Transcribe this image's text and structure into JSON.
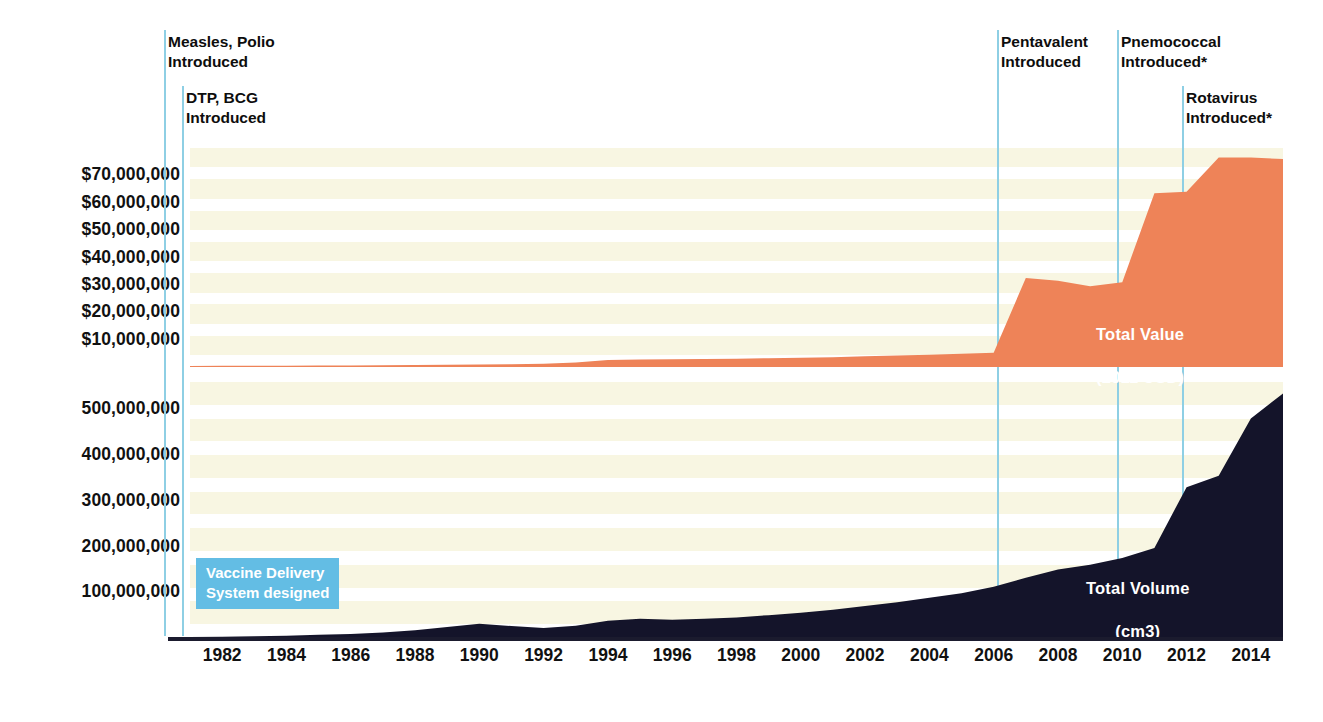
{
  "chart_data": {
    "type": "area",
    "title": "",
    "subtitle": "",
    "xlabel": "",
    "grid": true,
    "legend_position": "in-plot",
    "x": [
      1981,
      1982,
      1983,
      1984,
      1985,
      1986,
      1987,
      1988,
      1989,
      1990,
      1991,
      1992,
      1993,
      1994,
      1995,
      1996,
      1997,
      1998,
      1999,
      2000,
      2001,
      2002,
      2003,
      2004,
      2005,
      2006,
      2007,
      2008,
      2009,
      2010,
      2011,
      2012,
      2013,
      2014,
      2015
    ],
    "x_tick_labels": [
      "1982",
      "1984",
      "1986",
      "1988",
      "1990",
      "1992",
      "1994",
      "1996",
      "1998",
      "2000",
      "2002",
      "2004",
      "2006",
      "2008",
      "2010",
      "2012",
      "2014"
    ],
    "panels": [
      {
        "name": "Total Value (2011 USD)",
        "label_line1": "Total Value",
        "label_line2": "(2011 USD)",
        "color": "#ee8358",
        "ylabel": "",
        "ylim": [
          0,
          80000000
        ],
        "y_tick_labels": [
          "$70,000,000",
          "$60,000,000",
          "$50,000,000",
          "$40,000,000",
          "$30,000,000",
          "$20,000,000",
          "$10,000,000"
        ],
        "y_tick_values": [
          70000000,
          60000000,
          50000000,
          40000000,
          30000000,
          20000000,
          10000000
        ],
        "values": [
          400000,
          420000,
          450000,
          480000,
          520000,
          560000,
          620000,
          700000,
          820000,
          950000,
          1050000,
          1150000,
          1600000,
          2600000,
          2700000,
          2800000,
          2900000,
          3000000,
          3200000,
          3400000,
          3600000,
          3900000,
          4200000,
          4500000,
          4800000,
          5200000,
          32500000,
          31500000,
          29500000,
          31000000,
          63500000,
          64000000,
          76500000,
          76500000,
          76000000
        ]
      },
      {
        "name": "Total Volume (cm3)",
        "label_line1": "Total Volume",
        "label_line2": "(cm3)",
        "color": "#14142a",
        "ylabel": "",
        "ylim": [
          0,
          560000000
        ],
        "y_tick_labels": [
          "500,000,000",
          "400,000,000",
          "300,000,000",
          "200,000,000",
          "100,000,000"
        ],
        "y_tick_values": [
          500000000,
          400000000,
          300000000,
          200000000,
          100000000
        ],
        "values": [
          2000000,
          3000000,
          4000000,
          5000000,
          7000000,
          9000000,
          12000000,
          17000000,
          24000000,
          31000000,
          26000000,
          22000000,
          27000000,
          38000000,
          42000000,
          40000000,
          42000000,
          45000000,
          50000000,
          55000000,
          62000000,
          70000000,
          78000000,
          88000000,
          98000000,
          112000000,
          132000000,
          150000000,
          160000000,
          175000000,
          197000000,
          330000000,
          355000000,
          480000000,
          535000000
        ]
      }
    ],
    "annotations": [
      {
        "id": "measles-polio",
        "text": "Measles, Polio\nIntroduced",
        "year": 1981.0,
        "text_x": 168,
        "text_y": 32,
        "rule_x": 164,
        "rule_top": 30,
        "rule_bottom": 636
      },
      {
        "id": "dtp-bcg",
        "text": "DTP, BCG\nIntroduced",
        "year": 1981.6,
        "text_x": 186,
        "text_y": 88,
        "rule_x": 182,
        "rule_top": 86,
        "rule_bottom": 636
      },
      {
        "id": "pentavalent",
        "text": "Pentavalent\nIntroduced",
        "year": 2007.0,
        "text_x": 1001,
        "text_y": 32,
        "rule_x": 997,
        "rule_top": 30,
        "rule_bottom": 636
      },
      {
        "id": "pnemococcal",
        "text": "Pnemococcal\nIntroduced*",
        "year": 2011.0,
        "text_x": 1121,
        "text_y": 32,
        "rule_x": 1117,
        "rule_top": 30,
        "rule_bottom": 636
      },
      {
        "id": "rotavirus",
        "text": "Rotavirus\nIntroduced*",
        "year": 2013.0,
        "text_x": 1186,
        "text_y": 88,
        "rule_x": 1182,
        "rule_top": 86,
        "rule_bottom": 636
      }
    ],
    "callout": {
      "text": "Vaccine Delivery\nSystem designed",
      "background": "#63bde4",
      "text_color": "#ffffff"
    },
    "colors": {
      "value_area": "#ee8358",
      "volume_area": "#14142a",
      "annotation_rule": "#8ecfe4",
      "band": "#f6f3d8",
      "axis": "#1b1b2e",
      "text": "#111111"
    }
  }
}
